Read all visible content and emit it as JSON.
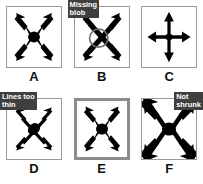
{
  "figure": {
    "background": "#ffffff",
    "panel_border_color": "#9a9a9a",
    "highlight_border_color": "#8c8c8c",
    "annotation_bg": "#3f3f3f",
    "annotation_fg": "#ffffff",
    "stroke_color": "#000000"
  },
  "panels": [
    {
      "id": "A",
      "caption": "A",
      "icon_name": "diagonal-four-arrow-cross-icon",
      "annotation": "",
      "highlighted": false
    },
    {
      "id": "B",
      "caption": "B",
      "icon_name": "diagonal-four-arrow-cross-no-blob-icon",
      "annotation": "Missing\nblob",
      "annotation_position": "top-left",
      "highlighted": false
    },
    {
      "id": "C",
      "caption": "C",
      "icon_name": "orthogonal-four-arrow-cross-icon",
      "annotation": "",
      "highlighted": false
    },
    {
      "id": "D",
      "caption": "D",
      "icon_name": "thin-diagonal-four-arrow-cross-icon",
      "annotation": "Lines too\nthin",
      "annotation_position": "top-left",
      "highlighted": false
    },
    {
      "id": "E",
      "caption": "E",
      "icon_name": "diagonal-four-arrow-cross-icon",
      "annotation": "",
      "highlighted": true
    },
    {
      "id": "F",
      "caption": "F",
      "icon_name": "oversized-diagonal-four-arrow-cross-icon",
      "annotation": "Not\nshrunk",
      "annotation_position": "top-right",
      "highlighted": false
    }
  ]
}
